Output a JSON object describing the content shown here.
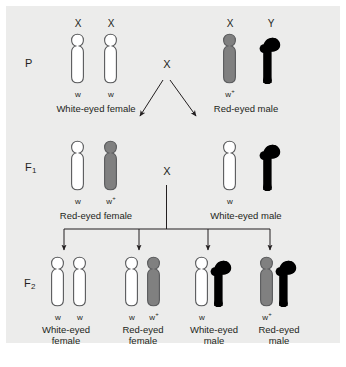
{
  "figure": {
    "panel_bg": "#ececeb",
    "page_bg": "#ffffff",
    "ink": "#231f20"
  },
  "colors": {
    "white_allele_fill": "#ffffff",
    "red_allele_fill": "#808080",
    "chromosome_outline": "#58595b",
    "y_chromosome_fill": "#000000",
    "arrow": "#231f20"
  },
  "generations": [
    {
      "id": "P",
      "label": "P",
      "label_sub": "",
      "cross_symbol": "X",
      "parents": [
        {
          "name": "white-eyed-female",
          "phenotype_line1": "White-eyed female",
          "phenotype_line2": "",
          "chromosomes": [
            {
              "type": "X",
              "header": "X",
              "allele": "w",
              "allele_sup": "",
              "fill": "white"
            },
            {
              "type": "X",
              "header": "X",
              "allele": "w",
              "allele_sup": "",
              "fill": "white"
            }
          ]
        },
        {
          "name": "red-eyed-male",
          "phenotype_line1": "Red-eyed male",
          "phenotype_line2": "",
          "chromosomes": [
            {
              "type": "X",
              "header": "X",
              "allele": "w",
              "allele_sup": "+",
              "fill": "gray"
            },
            {
              "type": "Y",
              "header": "Y",
              "allele": "",
              "allele_sup": "",
              "fill": "black"
            }
          ]
        }
      ]
    },
    {
      "id": "F1",
      "label": "F",
      "label_sub": "1",
      "cross_symbol": "X",
      "parents": [
        {
          "name": "red-eyed-female",
          "phenotype_line1": "Red-eyed female",
          "phenotype_line2": "",
          "chromosomes": [
            {
              "type": "X",
              "header": "",
              "allele": "w",
              "allele_sup": "",
              "fill": "white"
            },
            {
              "type": "X",
              "header": "",
              "allele": "w",
              "allele_sup": "+",
              "fill": "gray"
            }
          ]
        },
        {
          "name": "white-eyed-male",
          "phenotype_line1": "White-eyed male",
          "phenotype_line2": "",
          "chromosomes": [
            {
              "type": "X",
              "header": "",
              "allele": "w",
              "allele_sup": "",
              "fill": "white"
            },
            {
              "type": "Y",
              "header": "",
              "allele": "",
              "allele_sup": "",
              "fill": "black"
            }
          ]
        }
      ]
    },
    {
      "id": "F2",
      "label": "F",
      "label_sub": "2",
      "cross_symbol": "",
      "offspring": [
        {
          "name": "white-eyed-female",
          "phenotype_line1": "White-eyed",
          "phenotype_line2": "female",
          "chromosomes": [
            {
              "type": "X",
              "header": "",
              "allele": "w",
              "allele_sup": "",
              "fill": "white"
            },
            {
              "type": "X",
              "header": "",
              "allele": "w",
              "allele_sup": "",
              "fill": "white"
            }
          ]
        },
        {
          "name": "red-eyed-female",
          "phenotype_line1": "Red-eyed",
          "phenotype_line2": "female",
          "chromosomes": [
            {
              "type": "X",
              "header": "",
              "allele": "w",
              "allele_sup": "",
              "fill": "white"
            },
            {
              "type": "X",
              "header": "",
              "allele": "w",
              "allele_sup": "+",
              "fill": "gray"
            }
          ]
        },
        {
          "name": "white-eyed-male",
          "phenotype_line1": "White-eyed",
          "phenotype_line2": "male",
          "chromosomes": [
            {
              "type": "X",
              "header": "",
              "allele": "w",
              "allele_sup": "",
              "fill": "white"
            },
            {
              "type": "Y",
              "header": "",
              "allele": "",
              "allele_sup": "",
              "fill": "black"
            }
          ]
        },
        {
          "name": "red-eyed-male",
          "phenotype_line1": "Red-eyed",
          "phenotype_line2": "male",
          "chromosomes": [
            {
              "type": "X",
              "header": "",
              "allele": "w",
              "allele_sup": "+",
              "fill": "gray"
            },
            {
              "type": "Y",
              "header": "",
              "allele": "",
              "allele_sup": "",
              "fill": "black"
            }
          ]
        }
      ]
    }
  ]
}
